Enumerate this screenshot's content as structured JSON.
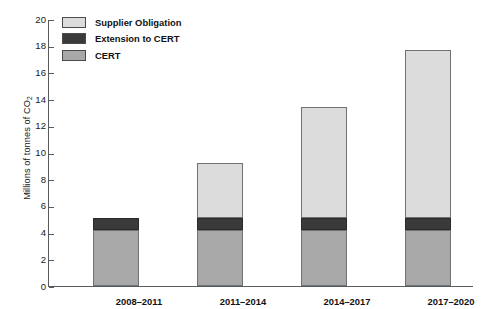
{
  "chart_data": {
    "type": "bar",
    "stacked": true,
    "title": "",
    "xlabel": "",
    "ylabel": "Millions of tonnes of CO2",
    "ylabel_parts": {
      "main": "Millions of tonnes of CO",
      "sub": "2"
    },
    "ylim": [
      0,
      20
    ],
    "ytick_step": 2,
    "yticks": [
      20,
      18,
      16,
      14,
      12,
      10,
      8,
      6,
      4,
      2,
      0
    ],
    "grid": false,
    "categories": [
      "2008–2011",
      "2011–2014",
      "2014–2017",
      "2017–2020"
    ],
    "series": [
      {
        "name": "CERT",
        "color": "#a8a8a8",
        "values": [
          4.2,
          4.2,
          4.2,
          4.2
        ]
      },
      {
        "name": "Extension to CERT",
        "color": "#3a3a3a",
        "values": [
          0.9,
          0.9,
          0.9,
          0.9
        ]
      },
      {
        "name": "Supplier Obligation",
        "color": "#dcdcdc",
        "values": [
          0,
          4.15,
          8.3,
          12.6
        ]
      }
    ],
    "totals": [
      5.1,
      9.25,
      13.4,
      17.7
    ],
    "legend": {
      "position": "top-left",
      "entries": [
        {
          "label": "Supplier Obligation",
          "color": "#dcdcdc"
        },
        {
          "label": "Extension to CERT",
          "color": "#3a3a3a"
        },
        {
          "label": "CERT",
          "color": "#a8a8a8"
        }
      ]
    }
  }
}
